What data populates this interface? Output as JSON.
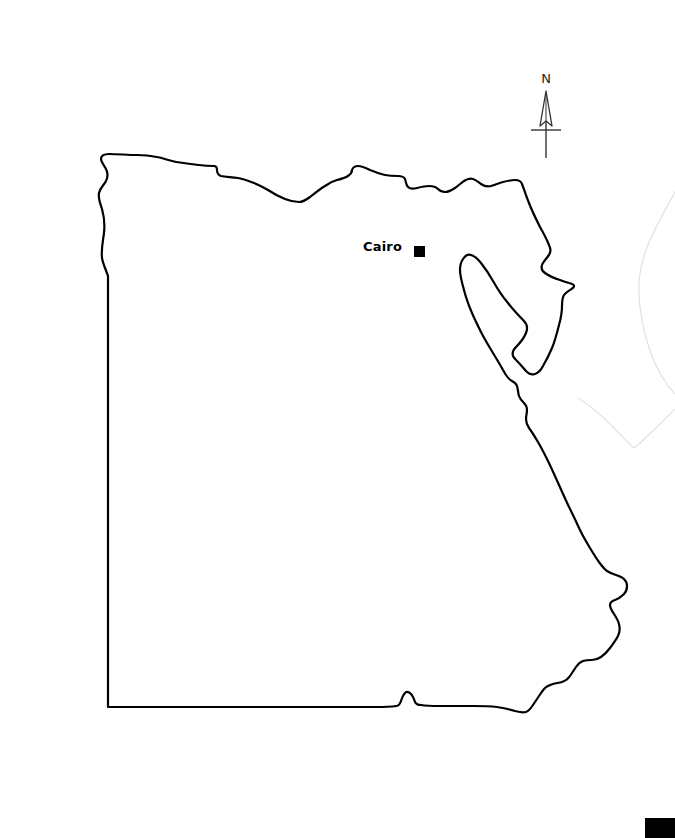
{
  "page": {
    "background_color": "#ffffff",
    "width": 675,
    "height": 838,
    "type": "outline-map"
  },
  "map": {
    "subject": "Egypt",
    "outline_color": "#000000",
    "outline_width": 2.2,
    "fill_color": "#ffffff",
    "neighbor_outline_color": "#e2e2e2",
    "neighbor_outline_width": 1.2
  },
  "cities": [
    {
      "name": "Cairo",
      "label": "Cairo",
      "marker": "filled-square",
      "marker_color": "#000000",
      "marker_size": 11,
      "marker_x": 414,
      "marker_y": 246,
      "label_x": 363,
      "label_y": 239
    }
  ],
  "compass": {
    "label": "N",
    "direction": "north",
    "style": "outlined-arrow-with-crossbar",
    "color": "#222222",
    "x": 524,
    "y": 72
  },
  "corner_mark": {
    "color": "#000000",
    "x": 645,
    "y": 818,
    "width": 30,
    "height": 20
  }
}
